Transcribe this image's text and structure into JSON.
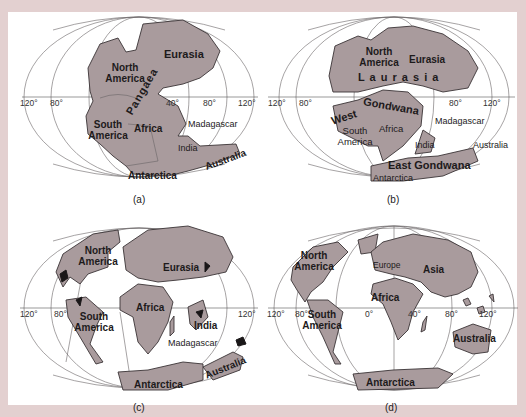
{
  "figure": {
    "background_color": "#e3d0d0",
    "land_color": "#a99b9d",
    "panels": [
      {
        "id": "a",
        "caption": "(a)",
        "ticks": [
          "120°",
          "80°",
          "40°",
          "80°",
          "120°"
        ],
        "labels": {
          "eurasia": "Eurasia",
          "north_america": "North America",
          "pangaea": "Pangaea",
          "south_america": "South America",
          "africa": "Africa",
          "madagascar": "Madagascar",
          "india": "India",
          "australia": "Australia",
          "antarctica": "Antarctica"
        }
      },
      {
        "id": "b",
        "caption": "(b)",
        "ticks": [
          "120°",
          "80°",
          "80°",
          "120°"
        ],
        "labels": {
          "north_america": "North America",
          "eurasia": "Eurasia",
          "laurasia": "L a u r a s i a",
          "gondwana": "Gondwana",
          "west": "West",
          "south_america": "South America",
          "africa": "Africa",
          "madagascar": "Madagascar",
          "india": "India",
          "australia": "Australia",
          "east_gondwana": "East Gondwana",
          "antarctica": "Antarctica"
        }
      },
      {
        "id": "c",
        "caption": "(c)",
        "ticks": [
          "120°",
          "80°",
          "120°"
        ],
        "labels": {
          "north_america": "North America",
          "eurasia": "Eurasia",
          "africa": "Africa",
          "south_america": "South America",
          "india": "India",
          "madagascar": "Madagascar",
          "australia": "Australia",
          "antarctica": "Antarctica"
        }
      },
      {
        "id": "d",
        "caption": "(d)",
        "ticks": [
          "120°",
          "80°",
          "0°",
          "40°",
          "80°",
          "120°"
        ],
        "labels": {
          "north_america": "North America",
          "europe": "Europe",
          "asia": "Asia",
          "africa": "Africa",
          "south_america": "South America",
          "australia": "Australia",
          "antarctica": "Antarctica"
        }
      }
    ]
  }
}
